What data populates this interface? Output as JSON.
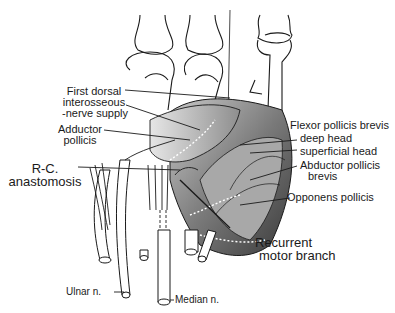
{
  "figure": {
    "colors": {
      "ink": "#1a1a1a",
      "shade": "#8a8a8a",
      "shade_dark": "#555555",
      "paper": "#ffffff"
    }
  },
  "labels": {
    "first_dorsal": {
      "line1": "First dorsal",
      "line2": "interosseous",
      "line3": "-nerve supply"
    },
    "adductor_pollicis": {
      "line1": "Adductor",
      "line2": "pollicis"
    },
    "rc_anastomosis": {
      "line1": "R-C.",
      "line2": "anastomosis"
    },
    "flexor_pollicis_brevis": "Flexor pollicis brevis",
    "deep_head": "deep head",
    "superficial_head": "superficial head",
    "abductor_pollicis_brevis": {
      "line1": "Abductor pollicis",
      "line2": "brevis"
    },
    "opponens_pollicis": "Opponens pollicis",
    "recurrent_motor_branch": {
      "line1": "Recurrent",
      "line2": "motor branch"
    },
    "ulnar_nerve": "Ulnar n.",
    "median_nerve": "Median n."
  }
}
